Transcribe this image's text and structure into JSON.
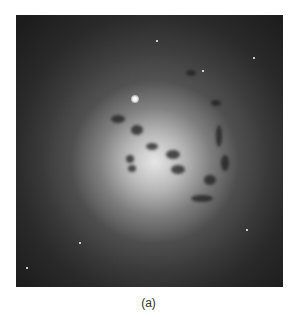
{
  "figure": {
    "image_description": "grayscale astronomical image of a galaxy with bright core and dark dust lanes",
    "caption": "(a)"
  },
  "colors": {
    "background": "#ffffff",
    "image_edge": "#1c1c1c",
    "core": "#ebebeb",
    "caption_text": "#333333"
  }
}
